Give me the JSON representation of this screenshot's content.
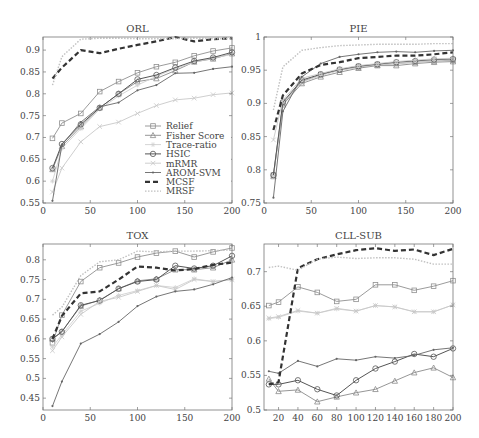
{
  "legend": {
    "entries": [
      {
        "name": "Relief",
        "marker": "square",
        "color": "#909090",
        "dash": "",
        "width": 0.9
      },
      {
        "name": "Fisher Score",
        "marker": "triangle",
        "color": "#8a8a8a",
        "dash": "",
        "width": 0.9
      },
      {
        "name": "Trace-ratio",
        "marker": "star",
        "color": "#d0d0d0",
        "dash": "",
        "width": 0.9
      },
      {
        "name": "HSIC",
        "marker": "circle",
        "color": "#555555",
        "dash": "",
        "width": 1.0
      },
      {
        "name": "mRMR",
        "marker": "cross",
        "color": "#c8c8c8",
        "dash": "",
        "width": 0.9
      },
      {
        "name": "AROM-SVM",
        "marker": "dot",
        "color": "#666666",
        "dash": "",
        "width": 0.9
      },
      {
        "name": "MCSF",
        "marker": "none",
        "color": "#333333",
        "dash": "5,3",
        "width": 2.2
      },
      {
        "name": "MRSF",
        "marker": "none",
        "color": "#c0c0c0",
        "dash": "1.5,1.5",
        "width": 1.4
      }
    ]
  },
  "chart_data": [
    {
      "type": "line",
      "title": "ORL",
      "xlabel": "",
      "ylabel": "",
      "xlim": [
        0,
        200
      ],
      "ylim": [
        0.55,
        0.93
      ],
      "xticks": [
        0,
        50,
        100,
        150,
        200
      ],
      "yticks": [
        0.55,
        0.6,
        0.65,
        0.7,
        0.75,
        0.8,
        0.85,
        0.9
      ],
      "ytick_labels": [
        "0.55",
        "0.6",
        "0.65",
        "0.7",
        "0.75",
        "0.8",
        "0.85",
        "0.9"
      ],
      "grid": false,
      "legend_position": "lower right",
      "box": {
        "left": 43,
        "top": 37,
        "width": 189,
        "height": 166
      },
      "x": [
        10,
        20,
        40,
        60,
        80,
        100,
        120,
        140,
        160,
        180,
        200
      ],
      "series": [
        {
          "name": "Relief",
          "values": [
            0.698,
            0.733,
            0.755,
            0.805,
            0.828,
            0.848,
            0.862,
            0.872,
            0.887,
            0.898,
            0.905
          ]
        },
        {
          "name": "Fisher Score",
          "values": [
            0.627,
            0.68,
            0.725,
            0.768,
            0.8,
            0.828,
            0.835,
            0.853,
            0.873,
            0.88,
            0.892
          ]
        },
        {
          "name": "Trace-ratio",
          "values": [
            0.6,
            0.675,
            0.72,
            0.765,
            0.795,
            0.82,
            0.84,
            0.858,
            0.872,
            0.882,
            0.89
          ]
        },
        {
          "name": "HSIC",
          "values": [
            0.63,
            0.685,
            0.73,
            0.768,
            0.8,
            0.833,
            0.843,
            0.86,
            0.875,
            0.883,
            0.895
          ]
        },
        {
          "name": "mRMR",
          "values": [
            0.575,
            0.63,
            0.69,
            0.725,
            0.735,
            0.755,
            0.773,
            0.786,
            0.79,
            0.798,
            0.802
          ]
        },
        {
          "name": "AROM-SVM",
          "values": [
            0.555,
            0.683,
            0.735,
            0.77,
            0.78,
            0.808,
            0.82,
            0.847,
            0.848,
            0.857,
            0.862
          ]
        },
        {
          "name": "MCSF",
          "values": [
            0.835,
            0.86,
            0.9,
            0.893,
            0.903,
            0.912,
            0.92,
            0.93,
            0.92,
            0.925,
            0.927
          ]
        },
        {
          "name": "MRSF",
          "values": [
            0.82,
            0.885,
            0.925,
            0.927,
            0.927,
            0.926,
            0.926,
            0.926,
            0.927,
            0.926,
            0.926
          ]
        }
      ]
    },
    {
      "type": "line",
      "title": "PIE",
      "xlabel": "",
      "ylabel": "",
      "xlim": [
        0,
        200
      ],
      "ylim": [
        0.75,
        1.0
      ],
      "xticks": [
        0,
        50,
        100,
        150,
        200
      ],
      "yticks": [
        0.75,
        0.8,
        0.85,
        0.9,
        0.95,
        1.0
      ],
      "ytick_labels": [
        "0.75",
        "0.8",
        "0.85",
        "0.9",
        "0.95",
        "1"
      ],
      "grid": false,
      "box": {
        "left": 264,
        "top": 37,
        "width": 189,
        "height": 166
      },
      "x": [
        10,
        20,
        40,
        60,
        80,
        100,
        120,
        140,
        160,
        180,
        200
      ],
      "series": [
        {
          "name": "Relief",
          "values": [
            0.792,
            0.9,
            0.933,
            0.943,
            0.95,
            0.955,
            0.958,
            0.96,
            0.962,
            0.964,
            0.965
          ]
        },
        {
          "name": "Fisher Score",
          "values": [
            0.79,
            0.898,
            0.93,
            0.94,
            0.947,
            0.953,
            0.957,
            0.957,
            0.96,
            0.962,
            0.963
          ]
        },
        {
          "name": "Trace-ratio",
          "values": [
            0.79,
            0.9,
            0.932,
            0.942,
            0.95,
            0.955,
            0.958,
            0.96,
            0.962,
            0.964,
            0.966
          ]
        },
        {
          "name": "HSIC",
          "values": [
            0.792,
            0.902,
            0.935,
            0.944,
            0.951,
            0.956,
            0.959,
            0.962,
            0.964,
            0.966,
            0.967
          ]
        },
        {
          "name": "mRMR",
          "values": [
            0.845,
            0.905,
            0.938,
            0.945,
            0.952,
            0.957,
            0.96,
            0.963,
            0.965,
            0.967,
            0.968
          ]
        },
        {
          "name": "AROM-SVM",
          "values": [
            0.758,
            0.888,
            0.94,
            0.96,
            0.97,
            0.974,
            0.977,
            0.978,
            0.977,
            0.979,
            0.98
          ]
        },
        {
          "name": "MCSF",
          "values": [
            0.86,
            0.912,
            0.945,
            0.958,
            0.962,
            0.968,
            0.97,
            0.972,
            0.972,
            0.974,
            0.977
          ]
        },
        {
          "name": "MRSF",
          "values": [
            0.89,
            0.955,
            0.98,
            0.984,
            0.987,
            0.988,
            0.989,
            0.989,
            0.989,
            0.99,
            0.99
          ]
        }
      ]
    },
    {
      "type": "line",
      "title": "TOX",
      "xlabel": "",
      "ylabel": "",
      "xlim": [
        0,
        200
      ],
      "ylim": [
        0.42,
        0.84
      ],
      "xticks": [
        0,
        50,
        100,
        150,
        200
      ],
      "yticks": [
        0.45,
        0.5,
        0.55,
        0.6,
        0.65,
        0.7,
        0.75,
        0.8
      ],
      "ytick_labels": [
        "0.45",
        "0.5",
        "0.55",
        "0.6",
        "0.65",
        "0.7",
        "0.75",
        "0.8"
      ],
      "grid": false,
      "box": {
        "left": 43,
        "top": 244,
        "width": 189,
        "height": 166
      },
      "x": [
        10,
        20,
        40,
        60,
        80,
        100,
        120,
        140,
        160,
        180,
        200
      ],
      "series": [
        {
          "name": "Relief",
          "values": [
            0.59,
            0.66,
            0.745,
            0.78,
            0.792,
            0.807,
            0.817,
            0.822,
            0.807,
            0.82,
            0.83
          ]
        },
        {
          "name": "Fisher Score",
          "values": [
            0.6,
            0.618,
            0.683,
            0.698,
            0.727,
            0.747,
            0.752,
            0.775,
            0.775,
            0.78,
            0.8
          ]
        },
        {
          "name": "Trace-ratio",
          "values": [
            0.58,
            0.61,
            0.67,
            0.69,
            0.71,
            0.722,
            0.735,
            0.73,
            0.752,
            0.745,
            0.75
          ]
        },
        {
          "name": "HSIC",
          "values": [
            0.6,
            0.618,
            0.685,
            0.697,
            0.727,
            0.745,
            0.75,
            0.785,
            0.778,
            0.785,
            0.81
          ]
        },
        {
          "name": "mRMR",
          "values": [
            0.57,
            0.605,
            0.662,
            0.695,
            0.705,
            0.72,
            0.735,
            0.725,
            0.75,
            0.745,
            0.75
          ]
        },
        {
          "name": "AROM-SVM",
          "values": [
            0.43,
            0.492,
            0.588,
            0.612,
            0.643,
            0.683,
            0.707,
            0.72,
            0.725,
            0.738,
            0.755
          ]
        },
        {
          "name": "MCSF",
          "values": [
            0.6,
            0.658,
            0.715,
            0.72,
            0.75,
            0.783,
            0.78,
            0.773,
            0.777,
            0.787,
            0.793
          ]
        },
        {
          "name": "MRSF",
          "values": [
            0.66,
            0.68,
            0.76,
            0.795,
            0.8,
            0.822,
            0.82,
            0.822,
            0.822,
            0.823,
            0.825
          ]
        }
      ]
    },
    {
      "type": "line",
      "title": "CLL-SUB",
      "xlabel": "",
      "ylabel": "",
      "xlim": [
        5,
        200
      ],
      "ylim": [
        0.5,
        0.74
      ],
      "xticks": [
        20,
        40,
        60,
        80,
        100,
        120,
        140,
        160,
        180,
        200
      ],
      "yticks": [
        0.5,
        0.55,
        0.6,
        0.65,
        0.7
      ],
      "ytick_labels": [
        "0.5",
        "0.55",
        "0.6",
        "0.65",
        "0.7"
      ],
      "grid": false,
      "box": {
        "left": 264,
        "top": 244,
        "width": 189,
        "height": 166
      },
      "x": [
        10,
        20,
        40,
        60,
        80,
        100,
        120,
        140,
        160,
        180,
        200
      ],
      "series": [
        {
          "name": "Relief",
          "values": [
            0.651,
            0.656,
            0.678,
            0.67,
            0.657,
            0.66,
            0.681,
            0.681,
            0.673,
            0.679,
            0.687
          ]
        },
        {
          "name": "Fisher Score",
          "values": [
            0.545,
            0.527,
            0.529,
            0.512,
            0.519,
            0.525,
            0.53,
            0.542,
            0.554,
            0.561,
            0.547
          ]
        },
        {
          "name": "Trace-ratio",
          "values": [
            0.632,
            0.634,
            0.643,
            0.64,
            0.646,
            0.643,
            0.651,
            0.649,
            0.642,
            0.642,
            0.652
          ]
        },
        {
          "name": "HSIC",
          "values": [
            0.537,
            0.537,
            0.543,
            0.53,
            0.521,
            0.543,
            0.56,
            0.57,
            0.581,
            0.577,
            0.589
          ]
        },
        {
          "name": "mRMR",
          "values": [
            0.633,
            0.635,
            0.644,
            0.64,
            0.647,
            0.643,
            0.651,
            0.649,
            0.642,
            0.642,
            0.652
          ]
        },
        {
          "name": "AROM-SVM",
          "values": [
            0.556,
            0.553,
            0.571,
            0.563,
            0.574,
            0.572,
            0.577,
            0.575,
            0.579,
            0.587,
            0.59
          ]
        },
        {
          "name": "MCSF",
          "values": [
            0.537,
            0.54,
            0.705,
            0.718,
            0.725,
            0.731,
            0.734,
            0.73,
            0.732,
            0.724,
            0.733
          ]
        },
        {
          "name": "MRSF",
          "values": [
            0.706,
            0.708,
            0.702,
            0.718,
            0.721,
            0.719,
            0.72,
            0.72,
            0.718,
            0.711,
            0.711
          ]
        }
      ]
    }
  ]
}
